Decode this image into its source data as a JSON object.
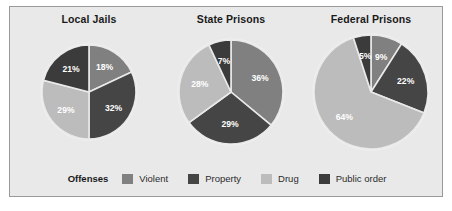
{
  "figure": {
    "background": "#ffffff",
    "panel_background": "#e9e9e9",
    "panel_border": "#9a9a9a"
  },
  "legend": {
    "title": "Offenses",
    "items": [
      {
        "label": "Violent",
        "color": "#808080"
      },
      {
        "label": "Property",
        "color": "#454545"
      },
      {
        "label": "Drug",
        "color": "#bcbcbc"
      },
      {
        "label": "Public order",
        "color": "#3b3b3b"
      }
    ]
  },
  "chart_data": [
    {
      "type": "pie",
      "title": "Local Jails",
      "categories": [
        "Violent",
        "Property",
        "Drug",
        "Public order"
      ],
      "values": [
        18,
        32,
        29,
        21
      ],
      "labels": [
        "18%",
        "32%",
        "29%",
        "21%"
      ],
      "colors": [
        "#808080",
        "#454545",
        "#bcbcbc",
        "#3b3b3b"
      ],
      "start_angle": 0,
      "radius": 47,
      "cx": 73,
      "cy": 62,
      "label_radius_frac": 0.62
    },
    {
      "type": "pie",
      "title": "State Prisons",
      "categories": [
        "Violent",
        "Property",
        "Drug",
        "Public order"
      ],
      "values": [
        36,
        29,
        28,
        7
      ],
      "labels": [
        "36%",
        "29%",
        "28%",
        "7%"
      ],
      "colors": [
        "#808080",
        "#454545",
        "#bcbcbc",
        "#3b3b3b"
      ],
      "start_angle": 0,
      "radius": 52,
      "cx": 73,
      "cy": 62,
      "label_radius_frac": 0.62
    },
    {
      "type": "pie",
      "title": "Federal Prisons",
      "categories": [
        "Violent",
        "Property",
        "Drug",
        "Public order"
      ],
      "values": [
        9,
        22,
        64,
        5
      ],
      "labels": [
        "9%",
        "22%",
        "64%",
        "5%"
      ],
      "colors": [
        "#808080",
        "#454545",
        "#bcbcbc",
        "#3b3b3b"
      ],
      "start_angle": 0,
      "radius": 57,
      "cx": 73,
      "cy": 62,
      "label_radius_frac": 0.64
    }
  ],
  "layout": {
    "chart_positions": [
      {
        "left": 6,
        "width": 146
      },
      {
        "left": 148,
        "width": 146
      },
      {
        "left": 288,
        "width": 146
      }
    ]
  }
}
